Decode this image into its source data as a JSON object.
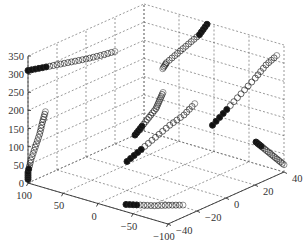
{
  "chart_data": {
    "type": "scatter3d",
    "title": "",
    "xlabel": "",
    "ylabel": "",
    "zlabel": "",
    "xlim": [
      -100,
      100
    ],
    "ylim": [
      -40,
      40
    ],
    "zlim": [
      0,
      350
    ],
    "x_ticks": [
      100,
      50,
      0,
      -50,
      -100
    ],
    "y_ticks": [
      -40,
      -20,
      0,
      20,
      40
    ],
    "z_ticks": [
      0,
      50,
      100,
      150,
      200,
      250,
      300,
      350
    ],
    "x_tick_labels": [
      "100",
      "50",
      "0",
      "−50",
      "−100"
    ],
    "y_tick_labels": [
      "−40",
      "−20",
      "0",
      "20",
      "40"
    ],
    "z_tick_labels": [
      "0",
      "50",
      "100",
      "150",
      "200",
      "250",
      "300",
      "350"
    ],
    "grid": true,
    "marker": "circle-open",
    "legend": null,
    "series": [
      {
        "name": "trajectory-1",
        "description": "line at x=100,z~300 along y",
        "points": [
          [
            100,
            -40,
            310
          ],
          [
            100,
            -30,
            300
          ],
          [
            100,
            -20,
            290
          ],
          [
            100,
            -10,
            280
          ],
          [
            100,
            0,
            270
          ],
          [
            100,
            10,
            262
          ],
          [
            100,
            20,
            255
          ]
        ]
      },
      {
        "name": "trajectory-2",
        "description": "vertical rise at x=100, y=-40",
        "points": [
          [
            100,
            -40,
            10
          ],
          [
            100,
            -40,
            30
          ],
          [
            100,
            -38,
            60
          ],
          [
            100,
            -35,
            90
          ],
          [
            100,
            -32,
            120
          ],
          [
            100,
            -30,
            150
          ],
          [
            100,
            -28,
            175
          ]
        ]
      },
      {
        "name": "trajectory-3",
        "description": "top back line x~0",
        "points": [
          [
            10,
            40,
            345
          ],
          [
            0,
            30,
            340
          ],
          [
            -5,
            20,
            335
          ],
          [
            -10,
            10,
            330
          ],
          [
            -15,
            0,
            325
          ],
          [
            -20,
            -5,
            320
          ]
        ]
      },
      {
        "name": "trajectory-4",
        "description": "middle diagonal",
        "points": [
          [
            30,
            0,
            100
          ],
          [
            20,
            0,
            130
          ],
          [
            10,
            0,
            160
          ],
          [
            0,
            0,
            190
          ],
          [
            -5,
            0,
            215
          ],
          [
            -10,
            0,
            240
          ]
        ]
      },
      {
        "name": "trajectory-5",
        "description": "center diagonal to right",
        "points": [
          [
            0,
            -20,
            80
          ],
          [
            -10,
            -15,
            110
          ],
          [
            -20,
            -10,
            140
          ],
          [
            -30,
            -5,
            170
          ],
          [
            -40,
            0,
            195
          ],
          [
            -45,
            5,
            220
          ]
        ]
      },
      {
        "name": "trajectory-6",
        "description": "right rising diagonal",
        "points": [
          [
            -60,
            10,
            160
          ],
          [
            -70,
            15,
            200
          ],
          [
            -80,
            20,
            240
          ],
          [
            -90,
            25,
            280
          ],
          [
            -95,
            30,
            310
          ],
          [
            -100,
            35,
            330
          ]
        ]
      },
      {
        "name": "trajectory-7",
        "description": "bottom front line",
        "points": [
          [
            -40,
            -40,
            20
          ],
          [
            -50,
            -35,
            15
          ],
          [
            -60,
            -30,
            10
          ],
          [
            -70,
            -25,
            8
          ],
          [
            -80,
            -20,
            5
          ]
        ]
      },
      {
        "name": "trajectory-8",
        "description": "bottom right line",
        "points": [
          [
            -60,
            40,
            60
          ],
          [
            -70,
            40,
            50
          ],
          [
            -80,
            40,
            40
          ],
          [
            -90,
            40,
            30
          ],
          [
            -100,
            40,
            20
          ]
        ]
      }
    ]
  },
  "colors": {
    "background": "#ffffff",
    "axis": "#333333",
    "grid": "#555555",
    "marker_stroke": "#222222",
    "marker_fill_dark": "#111111",
    "marker_fill_light": "#ffffff"
  }
}
